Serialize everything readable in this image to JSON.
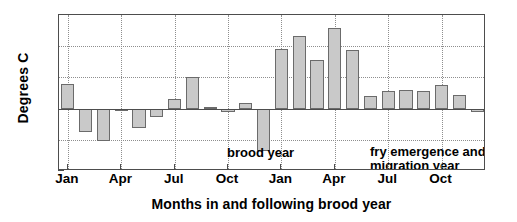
{
  "chart_data": {
    "type": "bar",
    "title": "",
    "subtitle": "",
    "xlabel": "Months in and following brood year",
    "ylabel": "Degrees C",
    "ylim": [
      -4,
      6
    ],
    "ytick_labels": [
      "6",
      "4",
      "2",
      "0",
      "-2",
      "-4"
    ],
    "ytick_values": [
      6,
      4,
      2,
      0,
      -2,
      -4
    ],
    "xtick_labels": [
      "Jan",
      "Apr",
      "Jul",
      "Oct",
      "Jan",
      "Apr",
      "Jul",
      "Oct"
    ],
    "xtick_indices": [
      0,
      3,
      6,
      9,
      12,
      15,
      18,
      21
    ],
    "grid": true,
    "legend": "none",
    "bar_fill_color": "#c9c9c9",
    "bar_edge_color": "#6b6b6b",
    "axis_color": "#4d4d4d",
    "grid_color": "#8e8e8e",
    "categories": [
      "Jan",
      "Feb",
      "Mar",
      "Apr",
      "May",
      "Jun",
      "Jul",
      "Aug",
      "Sep",
      "Oct",
      "Nov",
      "Dec",
      "Jan",
      "Feb",
      "Mar",
      "Apr",
      "May",
      "Jun",
      "Jul",
      "Aug",
      "Sep",
      "Oct",
      "Nov",
      "Dec"
    ],
    "values": [
      1.6,
      -1.5,
      -2.1,
      -0.15,
      -1.25,
      -0.55,
      0.6,
      2.05,
      0.08,
      -0.2,
      0.35,
      -2.75,
      3.8,
      4.65,
      3.1,
      5.15,
      3.75,
      0.8,
      1.1,
      1.2,
      1.1,
      1.5,
      0.9,
      -0.2
    ],
    "annotations": [
      {
        "id": "brood",
        "text": "brood year"
      },
      {
        "id": "fry",
        "text": "fry emergence and\nmigration year"
      }
    ]
  }
}
